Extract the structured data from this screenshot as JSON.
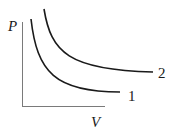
{
  "diagram": {
    "type": "pv-isotherms",
    "axes": {
      "y_label": "P",
      "x_label": "V"
    },
    "curves": [
      {
        "label": "1",
        "path": "M31,19 C38,70 55,92 120,92"
      },
      {
        "label": "2",
        "path": "M44,9 C52,50 70,70 153,72"
      }
    ],
    "colors": {
      "axis": "#7a7a7a",
      "curve": "#1a1a1a",
      "text": "#1a1a1a"
    }
  }
}
